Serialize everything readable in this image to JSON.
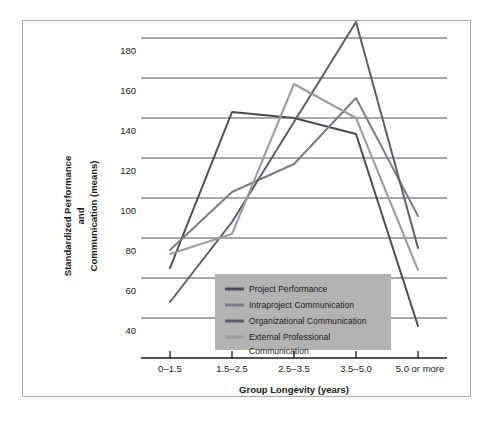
{
  "chart_data": {
    "type": "line",
    "title": "",
    "xlabel": "Group Longevity (years)",
    "ylabel": "Standardized Performance and Communication (means)",
    "ylabel_lines": [
      "Standardized Performance",
      "and",
      "Communication (means)"
    ],
    "categories": [
      "0–1.5",
      "1.5–2.5",
      "2.5–3.5",
      "3.5–5.0",
      "5.0 or more"
    ],
    "yticks": [
      40,
      60,
      80,
      100,
      120,
      140,
      160,
      180
    ],
    "ylim": [
      30,
      190
    ],
    "grid": true,
    "legend_position": "inside-bottom-left",
    "series": [
      {
        "name": "Project Performance",
        "color": "#4a4a52",
        "values": [
          65,
          143,
          140,
          132,
          36
        ]
      },
      {
        "name": "Intraproject Communication",
        "color": "#7b7b83",
        "values": [
          74,
          103,
          117,
          150,
          91
        ]
      },
      {
        "name": "Organizational Communication",
        "color": "#5d5d66",
        "values": [
          48,
          88,
          138,
          188,
          75
        ]
      },
      {
        "name": "External Professional Communication",
        "color": "#9b9ba2",
        "values": [
          72,
          82,
          157,
          140,
          64
        ]
      }
    ]
  },
  "legend": {
    "background": "#b3b3b3",
    "items": [
      "Project Performance",
      "Intraproject Communication",
      "Organizational Communication",
      "External Professional",
      "Communication"
    ]
  },
  "colors": {
    "frame": "#a8a8a8",
    "gridline": "#3a3a3a",
    "axis": "#1a1a1a",
    "text": "#1a1a1a",
    "background": "#ffffff"
  }
}
